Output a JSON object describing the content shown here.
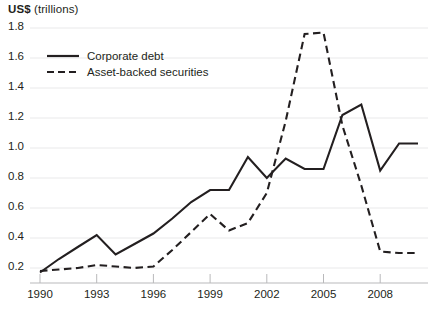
{
  "chart_data": {
    "type": "line",
    "title": "",
    "ylabel": "US$ (trillions)",
    "ylabel_bold_part": "US$",
    "ylabel_rest": " (trillions)",
    "xlabel": "",
    "ylim": [
      0.0,
      1.9
    ],
    "xlim": [
      1990,
      2010
    ],
    "grid": true,
    "grid_axis": "y",
    "legend_position": "top-left",
    "yticks": [
      0.2,
      0.4,
      0.6,
      0.8,
      1.0,
      1.2,
      1.4,
      1.6,
      1.8
    ],
    "ytick_labels": [
      "0.2",
      "0.4",
      "0.6",
      "0.8",
      "1.0",
      "1.2",
      "1.4",
      "1.6",
      "1.8"
    ],
    "xticks": [
      1990,
      1993,
      1996,
      1999,
      2002,
      2005,
      2008
    ],
    "xtick_labels": [
      "1990",
      "1993",
      "1996",
      "1999",
      "2002",
      "2005",
      "2008"
    ],
    "x": [
      1990,
      1991,
      1992,
      1993,
      1994,
      1995,
      1996,
      1997,
      1998,
      1999,
      2000,
      2001,
      2002,
      2003,
      2004,
      2005,
      2006,
      2007,
      2008,
      2009,
      2010
    ],
    "series": [
      {
        "name": "Corporate debt",
        "style": "solid",
        "color": "#231f20",
        "values": [
          0.17,
          0.26,
          0.34,
          0.42,
          0.29,
          0.36,
          0.43,
          0.53,
          0.64,
          0.72,
          0.72,
          0.94,
          0.8,
          0.93,
          0.86,
          0.86,
          1.22,
          1.29,
          0.85,
          1.03,
          1.03
        ]
      },
      {
        "name": "Asset-backed securities",
        "style": "dashed",
        "color": "#231f20",
        "values": [
          0.18,
          0.19,
          0.2,
          0.22,
          0.21,
          0.2,
          0.21,
          0.32,
          0.44,
          0.56,
          0.45,
          0.5,
          0.7,
          1.18,
          1.76,
          1.77,
          1.15,
          0.75,
          0.31,
          0.3,
          0.3
        ]
      }
    ]
  },
  "legend": {
    "items": [
      {
        "label": "Corporate debt",
        "style": "solid"
      },
      {
        "label": "Asset-backed securities",
        "style": "dashed"
      }
    ]
  },
  "axes": {
    "y_title_strong": "US$",
    "y_title_rest": " (trillions)"
  }
}
